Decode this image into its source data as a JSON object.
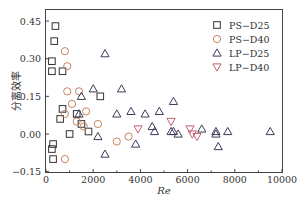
{
  "chart_data": {
    "type": "scatter",
    "title": "",
    "xlabel": "Re",
    "ylabel": "分离效率",
    "xlim": [
      0,
      10000
    ],
    "ylim": [
      -0.15,
      0.5
    ],
    "xticks": [
      0,
      2000,
      4000,
      6000,
      8000,
      10000
    ],
    "yticks": [
      -0.15,
      0.0,
      0.15,
      0.3,
      0.45
    ],
    "ytick_labels": [
      "−0.15",
      "0.00",
      "0.15",
      "0.30",
      "0.45"
    ],
    "grid": false,
    "legend_position": "upper right",
    "series": [
      {
        "name": "PS−D25",
        "marker": "square",
        "color": "#333333",
        "points": [
          [
            400,
            0.43
          ],
          [
            350,
            0.37
          ],
          [
            250,
            0.29
          ],
          [
            250,
            0.25
          ],
          [
            700,
            0.25
          ],
          [
            700,
            0.1
          ],
          [
            600,
            0.06
          ],
          [
            1000,
            0.0
          ],
          [
            300,
            -0.04
          ],
          [
            250,
            -0.06
          ],
          [
            300,
            -0.1
          ],
          [
            1300,
            0.08
          ],
          [
            1500,
            0.04
          ],
          [
            1800,
            0.01
          ],
          [
            2300,
            0.15
          ]
        ]
      },
      {
        "name": "PS−D40",
        "marker": "circle",
        "color": "#c8825e",
        "points": [
          [
            800,
            0.33
          ],
          [
            900,
            0.27
          ],
          [
            900,
            0.17
          ],
          [
            1400,
            0.17
          ],
          [
            1100,
            0.12
          ],
          [
            800,
            0.08
          ],
          [
            1300,
            0.05
          ],
          [
            1600,
            0.03
          ],
          [
            1700,
            0.09
          ],
          [
            2200,
            0.04
          ],
          [
            3000,
            -0.03
          ],
          [
            3500,
            -0.01
          ],
          [
            800,
            -0.1
          ]
        ]
      },
      {
        "name": "LP−D25",
        "marker": "triangle-up",
        "color": "#3c3c5a",
        "points": [
          [
            2500,
            0.32
          ],
          [
            2000,
            0.18
          ],
          [
            3200,
            0.18
          ],
          [
            1500,
            0.15
          ],
          [
            1400,
            0.08
          ],
          [
            3000,
            0.08
          ],
          [
            3600,
            0.09
          ],
          [
            4200,
            0.08
          ],
          [
            4500,
            0.03
          ],
          [
            4800,
            0.09
          ],
          [
            5400,
            0.13
          ],
          [
            5300,
            0.01
          ],
          [
            5600,
            0.0
          ],
          [
            6600,
            0.02
          ],
          [
            7200,
            0.01
          ],
          [
            7200,
            0.0
          ],
          [
            7700,
            0.01
          ],
          [
            9500,
            0.01
          ],
          [
            2200,
            -0.01
          ],
          [
            2500,
            -0.08
          ],
          [
            3800,
            -0.04
          ],
          [
            4600,
            0.01
          ],
          [
            5400,
            0.01
          ],
          [
            7300,
            -0.05
          ]
        ]
      },
      {
        "name": "LP−D40",
        "marker": "triangle-down",
        "color": "#c86070",
        "points": [
          [
            3900,
            0.02
          ],
          [
            5300,
            0.05
          ],
          [
            6100,
            0.02
          ],
          [
            6200,
            0.0
          ],
          [
            6400,
            -0.01
          ]
        ]
      }
    ]
  },
  "legend": {
    "items": [
      {
        "label": "PS−D25"
      },
      {
        "label": "PS−D40"
      },
      {
        "label": "LP−D25"
      },
      {
        "label": "LP−D40"
      }
    ]
  },
  "axes": {
    "xlabel": "Re",
    "ylabel": "分离效率",
    "xtick_labels": [
      "0",
      "2000",
      "4000",
      "6000",
      "8000",
      "10000"
    ],
    "ytick_labels": [
      "−0.15",
      "0.00",
      "0.15",
      "0.30",
      "0.45"
    ]
  }
}
